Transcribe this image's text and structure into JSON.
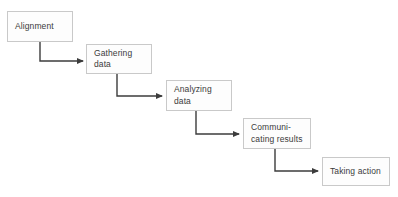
{
  "diagram": {
    "type": "stepped-flowchart",
    "canvas": {
      "width": 398,
      "height": 197,
      "background": "#ffffff"
    },
    "style": {
      "box_fill": "#fdfdfd",
      "box_border": "#c9c9c9",
      "text_color": "#3b3b3b",
      "connector_color": "#3c3c3c"
    },
    "stages": [
      {
        "id": "alignment",
        "label": "Alignment",
        "x": 7,
        "y": 11,
        "width": 66,
        "height": 31
      },
      {
        "id": "gathering-data",
        "label": "Gathering\ndata",
        "x": 86,
        "y": 44,
        "width": 66,
        "height": 30
      },
      {
        "id": "analyzing-data",
        "label": "Analyzing\ndata",
        "x": 166,
        "y": 80,
        "width": 66,
        "height": 31
      },
      {
        "id": "communicating-results",
        "label": "Communi-\ncating results",
        "x": 243,
        "y": 118,
        "width": 68,
        "height": 31
      },
      {
        "id": "taking-action",
        "label": "Taking action",
        "x": 322,
        "y": 157,
        "width": 68,
        "height": 29
      }
    ],
    "connectors": [
      {
        "id": "alignment-to-gathering-data",
        "from": "alignment",
        "to": "gathering-data",
        "path": "M 40 42 L 40 61 L 83 61",
        "arrow_x": 84,
        "arrow_y": 61
      },
      {
        "id": "gathering-data-to-analyzing-data",
        "from": "gathering-data",
        "to": "analyzing-data",
        "path": "M 117 74 L 117 96 L 162 96",
        "arrow_x": 163,
        "arrow_y": 96
      },
      {
        "id": "analyzing-data-to-communicating-results",
        "from": "analyzing-data",
        "to": "communicating-results",
        "path": "M 196 111 L 196 134 L 239 134",
        "arrow_x": 240,
        "arrow_y": 134
      },
      {
        "id": "communicating-results-to-taking-action",
        "from": "communicating-results",
        "to": "taking-action",
        "path": "M 275 149 L 275 171 L 318 171",
        "arrow_x": 319,
        "arrow_y": 171
      }
    ]
  }
}
